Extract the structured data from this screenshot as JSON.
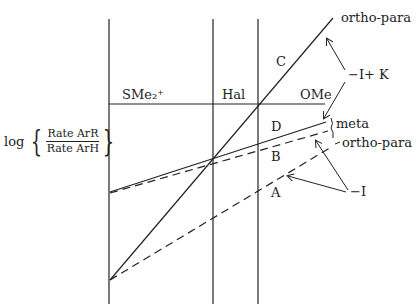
{
  "figure": {
    "y_axis_label": {
      "prefix": "log",
      "numerator": "Rate ArR",
      "denominator": "Rate ArH"
    },
    "column_labels": [
      "SMe₂⁺",
      "Hal",
      "OMe"
    ],
    "line_labels": {
      "A": "A",
      "B": "B",
      "C": "C",
      "D": "D"
    },
    "end_labels": {
      "top_ortho_para": "ortho-para",
      "meta": "meta",
      "lower_ortho_para": "ortho-para"
    },
    "effect_labels": {
      "minus_I_plus_K": "−I+ K",
      "minus_I": "−I"
    },
    "colors": {
      "line": "#222222",
      "background": "#ffffff"
    }
  }
}
